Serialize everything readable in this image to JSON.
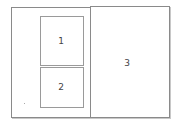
{
  "diagram": {
    "left_page": {
      "boxes": [
        {
          "label": "1"
        },
        {
          "label": "2"
        }
      ]
    },
    "right_page": {
      "label": "3"
    }
  }
}
